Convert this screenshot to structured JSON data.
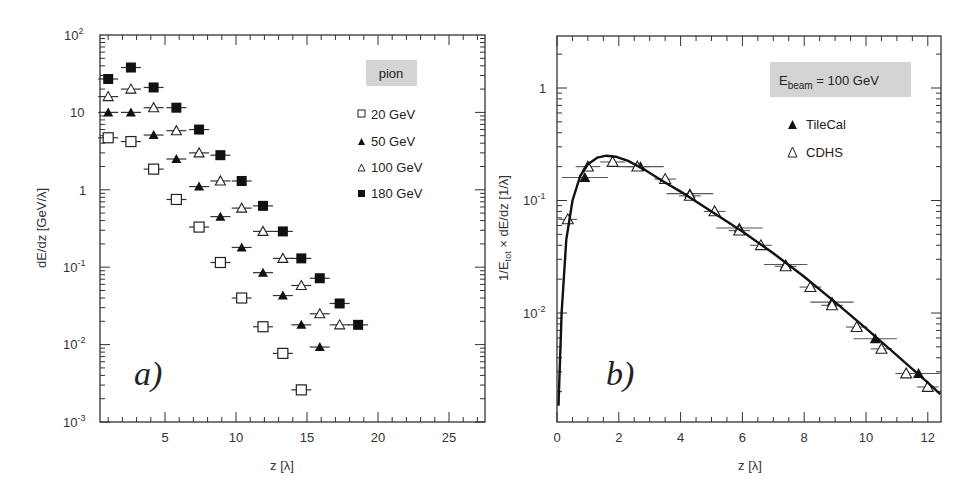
{
  "chart_data": [
    {
      "type": "scatter",
      "panel_label": "a)",
      "title": "",
      "xlabel": "z [λ]",
      "ylabel": "dE/dz [GeV/λ]",
      "xlim": [
        0.7,
        27
      ],
      "ylim": [
        0.001,
        100
      ],
      "yscale": "log",
      "xticks": [
        5,
        10,
        15,
        20,
        25
      ],
      "yticks": [
        "10^-3",
        "10^-2",
        "10^-1",
        "1",
        "10",
        "10^2"
      ],
      "grid": false,
      "legend_title": "pion",
      "legend_position": "upper right",
      "series": [
        {
          "name": "20 GeV",
          "marker": "open-square",
          "x": [
            1.0,
            2.6,
            4.2,
            5.8,
            7.4,
            8.9,
            10.4,
            11.9,
            13.3,
            14.6
          ],
          "y": [
            4.7,
            4.2,
            1.85,
            0.75,
            0.33,
            0.115,
            0.04,
            0.017,
            0.0077,
            0.0026
          ]
        },
        {
          "name": "50 GeV",
          "marker": "filled-triangle",
          "x": [
            1.0,
            2.6,
            4.2,
            5.8,
            7.4,
            8.9,
            10.4,
            11.9,
            13.3,
            14.6,
            15.9
          ],
          "y": [
            10,
            10,
            5.1,
            2.5,
            1.1,
            0.45,
            0.18,
            0.085,
            0.043,
            0.018,
            0.0093
          ]
        },
        {
          "name": "100 GeV",
          "marker": "open-triangle",
          "x": [
            1.0,
            2.6,
            4.2,
            5.8,
            7.4,
            8.9,
            10.4,
            11.9,
            13.3,
            14.6,
            15.9,
            17.3
          ],
          "y": [
            16,
            20,
            11.5,
            5.8,
            3.0,
            1.3,
            0.58,
            0.29,
            0.13,
            0.058,
            0.025,
            0.018
          ]
        },
        {
          "name": "180 GeV",
          "marker": "filled-square",
          "x": [
            1.0,
            2.6,
            4.2,
            5.8,
            7.4,
            8.9,
            10.4,
            11.9,
            13.3,
            14.6,
            15.9,
            17.3,
            18.6
          ],
          "y": [
            27,
            38,
            21,
            11.5,
            6.0,
            2.8,
            1.3,
            0.62,
            0.29,
            0.13,
            0.072,
            0.034,
            0.018
          ]
        }
      ]
    },
    {
      "type": "scatter",
      "panel_label": "b)",
      "title": "",
      "xlabel": "z [λ]",
      "ylabel": "1/E_tot × dE/dz [1/λ]",
      "xlim": [
        0,
        12.4
      ],
      "ylim": [
        0.0013,
        3
      ],
      "yscale": "log",
      "xticks": [
        0,
        2,
        4,
        6,
        8,
        10,
        12
      ],
      "yticks": [
        "10^-2",
        "10^-1",
        "1"
      ],
      "grid": false,
      "legend_title": "E_beam = 100 GeV",
      "legend_position": "upper right",
      "series": [
        {
          "name": "TileCal",
          "marker": "filled-triangle",
          "x": [
            0.9,
            2.7,
            4.3,
            5.9,
            7.4,
            8.9,
            10.3,
            11.7
          ],
          "y": [
            0.16,
            0.2,
            0.115,
            0.057,
            0.027,
            0.0125,
            0.0059,
            0.0029
          ],
          "xerr": [
            0.75,
            0.75,
            0.75,
            0.75,
            0.7,
            0.7,
            0.7,
            0.7
          ]
        },
        {
          "name": "CDHS",
          "marker": "open-triangle",
          "x": [
            0.35,
            1.0,
            1.8,
            2.6,
            3.5,
            4.3,
            5.1,
            5.9,
            6.6,
            7.4,
            8.2,
            8.9,
            9.7,
            10.5,
            11.3,
            12.0
          ],
          "y": [
            0.068,
            0.2,
            0.22,
            0.2,
            0.155,
            0.11,
            0.08,
            0.054,
            0.04,
            0.026,
            0.017,
            0.0117,
            0.0075,
            0.0048,
            0.0029,
            0.0022
          ],
          "xerr": [
            0.3,
            0.4,
            0.4,
            0.4,
            0.35,
            0.35,
            0.35,
            0.35,
            0.35,
            0.35,
            0.35,
            0.35,
            0.35,
            0.35,
            0.35,
            0.35
          ]
        },
        {
          "name": "fit",
          "type": "line",
          "x": [
            0.05,
            0.15,
            0.3,
            0.5,
            0.75,
            1.0,
            1.3,
            1.6,
            1.9,
            2.3,
            2.8,
            3.4,
            4.0,
            5.0,
            6.0,
            7.0,
            8.0,
            9.0,
            10.0,
            11.0,
            12.0,
            12.4
          ],
          "y": [
            0.0015,
            0.01,
            0.045,
            0.1,
            0.165,
            0.21,
            0.24,
            0.25,
            0.245,
            0.225,
            0.19,
            0.15,
            0.12,
            0.08,
            0.053,
            0.034,
            0.021,
            0.0125,
            0.0073,
            0.0042,
            0.0024,
            0.0019
          ]
        }
      ]
    }
  ],
  "panel_a": {
    "label": "a)",
    "xlabel": "z [λ]",
    "ylabel": "dE/dz [GeV/λ]",
    "legend_title": "pion",
    "legend": [
      "20 GeV",
      "50 GeV",
      "100 GeV",
      "180 GeV"
    ],
    "xtick_labels": [
      "5",
      "10",
      "15",
      "20",
      "25"
    ]
  },
  "panel_b": {
    "label": "b)",
    "xlabel": "z [λ]",
    "ylabel_main": "1/E",
    "ylabel_sub": "tot",
    "ylabel_rest": " × dE/dz [1/λ]",
    "legend_title_main": "E",
    "legend_title_sub": "beam",
    "legend_title_rest": " = 100 GeV",
    "legend": [
      "TileCal",
      "CDHS"
    ],
    "xtick_labels": [
      "0",
      "2",
      "4",
      "6",
      "8",
      "10",
      "12"
    ],
    "ytick_labels": [
      "1",
      "10",
      "10",
      "-1",
      "-2"
    ]
  }
}
